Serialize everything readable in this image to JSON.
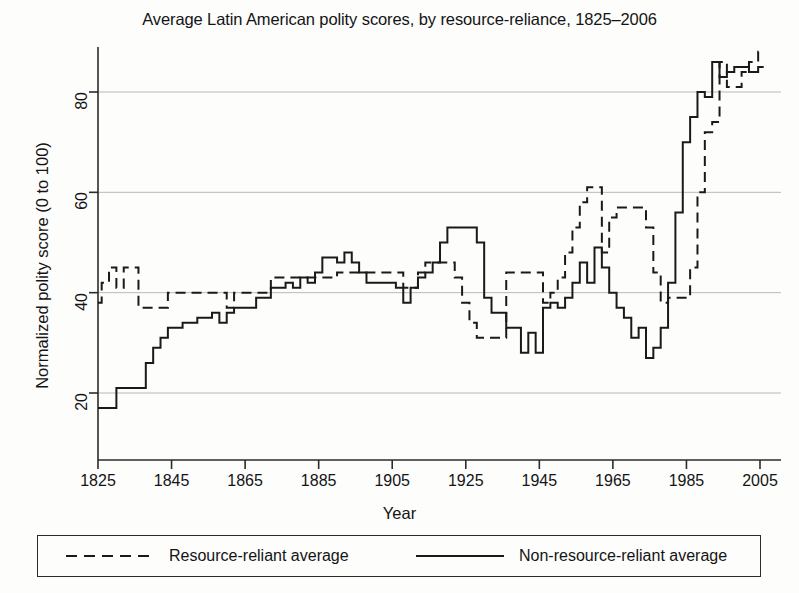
{
  "chart_data": {
    "type": "line",
    "title": "Average Latin American polity scores, by resource-reliance, 1825–2006",
    "xlabel": "Year",
    "ylabel": "Normalized polity score (0 to 100)",
    "xlim": [
      1825,
      2010
    ],
    "ylim": [
      13,
      92
    ],
    "xticks": [
      1825,
      1845,
      1865,
      1885,
      1905,
      1925,
      1945,
      1965,
      1985,
      2005
    ],
    "yticks": [
      20,
      40,
      60,
      80
    ],
    "grid": "horizontal",
    "legend_position": "below-plot",
    "series": [
      {
        "name": "Resource-reliant average",
        "style": "dashed",
        "color": "#1a1a1a",
        "x": [
          1825,
          1827,
          1829,
          1831,
          1833,
          1835,
          1837,
          1839,
          1841,
          1843,
          1845,
          1847,
          1849,
          1851,
          1853,
          1855,
          1857,
          1859,
          1861,
          1863,
          1865,
          1867,
          1869,
          1871,
          1873,
          1875,
          1877,
          1879,
          1881,
          1883,
          1885,
          1887,
          1889,
          1891,
          1893,
          1895,
          1897,
          1899,
          1901,
          1903,
          1905,
          1907,
          1909,
          1911,
          1913,
          1915,
          1917,
          1919,
          1921,
          1923,
          1925,
          1927,
          1929,
          1931,
          1933,
          1935,
          1937,
          1939,
          1941,
          1943,
          1945,
          1947,
          1949,
          1951,
          1953,
          1955,
          1957,
          1959,
          1961,
          1963,
          1965,
          1967,
          1969,
          1971,
          1973,
          1975,
          1977,
          1979,
          1981,
          1983,
          1985,
          1987,
          1989,
          1991,
          1993,
          1995,
          1997,
          1999,
          2001,
          2003,
          2006
        ],
        "values": [
          38,
          42,
          45,
          41,
          45,
          45,
          37,
          37,
          37,
          37,
          40,
          40,
          40,
          40,
          40,
          40,
          40,
          40,
          37,
          40,
          40,
          40,
          40,
          40,
          43,
          43,
          43,
          43,
          43,
          43,
          43,
          43,
          43,
          44,
          44,
          44,
          44,
          44,
          44,
          44,
          44,
          44,
          41,
          41,
          44,
          46,
          46,
          46,
          46,
          43,
          38,
          34,
          31,
          31,
          31,
          31,
          44,
          44,
          44,
          44,
          44,
          38,
          40,
          43,
          48,
          53,
          58,
          61,
          61,
          48,
          55,
          57,
          57,
          57,
          57,
          53,
          44,
          38,
          39,
          39,
          39,
          45,
          60,
          72,
          74,
          86,
          81,
          81,
          84,
          86,
          88
        ]
      },
      {
        "name": "Non-resource-reliant average",
        "style": "solid",
        "color": "#1a1a1a",
        "x": [
          1825,
          1827,
          1829,
          1831,
          1833,
          1835,
          1837,
          1839,
          1841,
          1843,
          1845,
          1847,
          1849,
          1851,
          1853,
          1855,
          1857,
          1859,
          1861,
          1863,
          1865,
          1867,
          1869,
          1871,
          1873,
          1875,
          1877,
          1879,
          1881,
          1883,
          1885,
          1887,
          1889,
          1891,
          1893,
          1895,
          1897,
          1899,
          1901,
          1903,
          1905,
          1907,
          1909,
          1911,
          1913,
          1915,
          1917,
          1919,
          1921,
          1923,
          1925,
          1927,
          1929,
          1931,
          1933,
          1935,
          1937,
          1939,
          1941,
          1943,
          1945,
          1947,
          1949,
          1951,
          1953,
          1955,
          1957,
          1959,
          1961,
          1963,
          1965,
          1967,
          1969,
          1971,
          1973,
          1975,
          1977,
          1979,
          1981,
          1983,
          1985,
          1987,
          1989,
          1991,
          1993,
          1995,
          1997,
          1999,
          2001,
          2003,
          2006
        ],
        "values": [
          17,
          17,
          17,
          21,
          21,
          21,
          21,
          26,
          29,
          31,
          33,
          33,
          34,
          34,
          35,
          35,
          36,
          34,
          36,
          37,
          37,
          37,
          39,
          39,
          41,
          41,
          42,
          41,
          43,
          42,
          44,
          47,
          47,
          46,
          48,
          46,
          44,
          42,
          42,
          42,
          42,
          41,
          38,
          41,
          43,
          44,
          46,
          50,
          53,
          53,
          53,
          53,
          50,
          39,
          36,
          36,
          33,
          33,
          28,
          32,
          28,
          37,
          38,
          37,
          39,
          42,
          46,
          42,
          49,
          45,
          40,
          37,
          35,
          31,
          33,
          27,
          29,
          33,
          42,
          56,
          70,
          75,
          80,
          79,
          86,
          83,
          84,
          85,
          85,
          84,
          85
        ]
      }
    ]
  },
  "legend": {
    "entries": [
      {
        "label": "Resource-reliant average",
        "style": "dashed"
      },
      {
        "label": "Non-resource-reliant average",
        "style": "solid"
      }
    ]
  },
  "colors": {
    "line": "#1a1a1a",
    "axis": "#2b2b2b",
    "grid": "#b9b9b9",
    "background": "#fdfdfc"
  }
}
